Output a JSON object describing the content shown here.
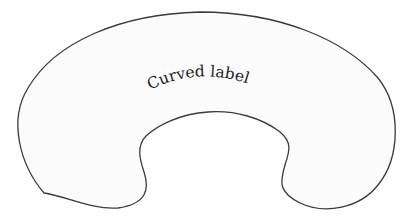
{
  "diagram": {
    "shape": {
      "type": "curved-horseshoe-region",
      "fill": "#fbfbfb",
      "stroke": "#3a3a3a"
    },
    "label": {
      "text": "Curved label",
      "color": "#222222"
    }
  }
}
